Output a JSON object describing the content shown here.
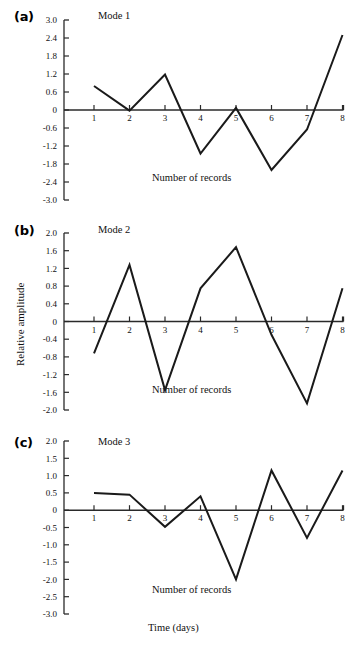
{
  "figure": {
    "xaxis_title": "Time (days)",
    "inner_xlabel": "Number of records",
    "shared_ylabel": "Relative amplitude"
  },
  "panels": [
    {
      "letter": "(a)",
      "title": "Mode 1",
      "inner_xlabel": "Number of records"
    },
    {
      "letter": "(b)",
      "title": "Mode 2",
      "inner_xlabel": "Number of records"
    },
    {
      "letter": "(c)",
      "title": "Mode 3",
      "inner_xlabel": "Number of records"
    }
  ],
  "chart_data": [
    {
      "type": "line",
      "title": "Mode 1",
      "panel": "(a)",
      "xlabel": "Number of records",
      "ylabel": "Relative amplitude",
      "x": [
        1,
        2,
        3,
        4,
        5,
        6,
        7,
        8
      ],
      "values": [
        0.8,
        -0.02,
        1.18,
        -1.45,
        0.07,
        -2.0,
        -0.65,
        2.5
      ],
      "categories": [
        "1",
        "2",
        "3",
        "4",
        "5",
        "6",
        "7",
        "8"
      ],
      "xtick_labels": [
        "1",
        "2",
        "3",
        "4",
        "5",
        "6",
        "7",
        "8"
      ],
      "ytick_labels": [
        "3.0",
        "2.4",
        "1.8",
        "1.2",
        "0.6",
        "0",
        "-0.6",
        "-1.2",
        "-1.8",
        "-2.4",
        "-3.0"
      ],
      "ytick_values": [
        3.0,
        2.4,
        1.8,
        1.2,
        0.6,
        0,
        -0.6,
        -1.2,
        -1.8,
        -2.4,
        -3.0
      ],
      "ylim": [
        -3.0,
        3.0
      ],
      "xlim": [
        0.5,
        8.3
      ],
      "grid": false,
      "legend": false
    },
    {
      "type": "line",
      "title": "Mode 2",
      "panel": "(b)",
      "xlabel": "Number of records",
      "ylabel": "Relative amplitude",
      "x": [
        1,
        2,
        3,
        4,
        5,
        6,
        7,
        8
      ],
      "values": [
        -0.72,
        1.28,
        -1.55,
        0.75,
        1.68,
        -0.3,
        -1.85,
        0.75
      ],
      "categories": [
        "1",
        "2",
        "3",
        "4",
        "5",
        "6",
        "7",
        "8"
      ],
      "xtick_labels": [
        "1",
        "2",
        "3",
        "4",
        "5",
        "6",
        "7",
        "8"
      ],
      "ytick_labels": [
        "2.0",
        "1.6",
        "1.2",
        "0.8",
        "0.4",
        "0",
        "-0.4",
        "-0.8",
        "-1.2",
        "-1.6",
        "-2.0"
      ],
      "ytick_values": [
        2.0,
        1.6,
        1.2,
        0.8,
        0.4,
        0,
        -0.4,
        -0.8,
        -1.2,
        -1.6,
        -2.0
      ],
      "ylim": [
        -2.0,
        2.0
      ],
      "xlim": [
        0.5,
        8.3
      ],
      "grid": false,
      "legend": false
    },
    {
      "type": "line",
      "title": "Mode 3",
      "panel": "(c)",
      "xlabel": "Time (days)",
      "ylabel": "Relative amplitude",
      "x": [
        1,
        2,
        3,
        4,
        5,
        6,
        7,
        8
      ],
      "values": [
        0.5,
        0.45,
        -0.48,
        0.4,
        -2.0,
        1.15,
        -0.8,
        1.15
      ],
      "categories": [
        "1",
        "2",
        "3",
        "4",
        "5",
        "6",
        "7",
        "8"
      ],
      "xtick_labels": [
        "1",
        "2",
        "3",
        "4",
        "5",
        "6",
        "7",
        "8"
      ],
      "ytick_labels": [
        "2.0",
        "1.5",
        "1.0",
        "0.5",
        "0",
        "-0.5",
        "-1.0",
        "-1.5",
        "-2.0",
        "-2.5",
        "-3.0"
      ],
      "ytick_values": [
        2.0,
        1.5,
        1.0,
        0.5,
        0,
        -0.5,
        -1.0,
        -1.5,
        -2.0,
        -2.5,
        -3.0
      ],
      "ylim": [
        -3.0,
        2.0
      ],
      "xlim": [
        0.5,
        8.3
      ],
      "grid": false,
      "legend": false
    }
  ],
  "style": {
    "line_color": "#1a1a1a",
    "axis_color": "#2a2a2a",
    "background": "#ffffff"
  }
}
